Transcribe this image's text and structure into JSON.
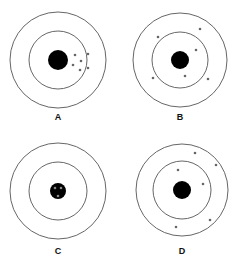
{
  "figure": {
    "colors": {
      "ring": "#555555",
      "bullseye": "#000000",
      "shot": "#666666",
      "background": "#ffffff"
    },
    "targets": [
      {
        "label": "A",
        "center": [
          58,
          60
        ],
        "outer_r": 48,
        "inner_r": 29,
        "bull_r": 10,
        "shots": [
          [
            75,
            55
          ],
          [
            88,
            54
          ],
          [
            81,
            61
          ],
          [
            73,
            65
          ],
          [
            80,
            70
          ],
          [
            88,
            68
          ]
        ],
        "label_pos": [
          58,
          112
        ]
      },
      {
        "label": "B",
        "center": [
          180,
          60
        ],
        "outer_r": 47,
        "inner_r": 28,
        "bull_r": 9,
        "shots": [
          [
            158,
            37
          ],
          [
            200,
            29
          ],
          [
            196,
            50
          ],
          [
            153,
            78
          ],
          [
            185,
            76
          ],
          [
            208,
            79
          ]
        ],
        "label_pos": [
          180,
          112
        ]
      },
      {
        "label": "C",
        "center": [
          58,
          191
        ],
        "outer_r": 48,
        "inner_r": 29,
        "bull_r": 8,
        "shots": [
          [
            55,
            188
          ],
          [
            61,
            188
          ],
          [
            58,
            196
          ]
        ],
        "shot_color": "#888888",
        "label_pos": [
          58,
          246
        ]
      },
      {
        "label": "D",
        "center": [
          182,
          190
        ],
        "outer_r": 46,
        "inner_r": 29,
        "bull_r": 9,
        "shots": [
          [
            195,
            153
          ],
          [
            216,
            165
          ],
          [
            178,
            170
          ],
          [
            203,
            184
          ],
          [
            210,
            220
          ],
          [
            176,
            227
          ]
        ],
        "label_pos": [
          182,
          246
        ]
      }
    ]
  }
}
